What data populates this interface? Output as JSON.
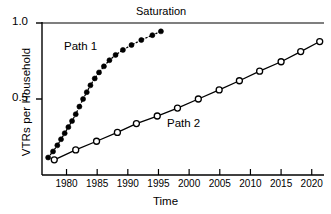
{
  "chart_data": {
    "type": "line",
    "title": "",
    "xlabel": "Time",
    "ylabel": "VTRs per Household",
    "xlim": [
      1976,
      2022
    ],
    "ylim": [
      0.08,
      1.0
    ],
    "grid": false,
    "legend_position": "inline-annotations",
    "ytick_labels": [
      "1.0",
      "0.5"
    ],
    "ytick_values": [
      1.0,
      0.5
    ],
    "xtick_labels": [
      "1980",
      "1985",
      "1990",
      "1995",
      "2000",
      "2005",
      "2010",
      "2015",
      "2020"
    ],
    "xtick_values": [
      1980,
      1985,
      1990,
      1995,
      2000,
      2005,
      2010,
      2015,
      2020
    ],
    "annotations": [
      {
        "text": "Saturation",
        "x": 1996,
        "y": 1.0,
        "name": "saturation-label"
      },
      {
        "text": "Path 1",
        "x": 1982,
        "y": 0.88,
        "name": "path1-label"
      },
      {
        "text": "Path 2",
        "x": 2000,
        "y": 0.42,
        "name": "path2-label"
      }
    ],
    "reference_lines": [
      {
        "name": "saturation-line",
        "orientation": "horizontal",
        "y": 1.0,
        "color": "#000000"
      }
    ],
    "series": [
      {
        "name": "Path 1",
        "marker": "filled-circle",
        "linestyle": "dotted",
        "color": "#000000",
        "x": [
          1977.0,
          1977.8,
          1978.5,
          1979.1,
          1979.7,
          1980.3,
          1980.9,
          1981.5,
          1982.1,
          1982.7,
          1983.3,
          1983.9,
          1984.6,
          1985.3,
          1986.1,
          1987.0,
          1988.0,
          1989.2,
          1990.6,
          1992.2,
          1994.0,
          1995.4
        ],
        "y": [
          0.115,
          0.155,
          0.195,
          0.235,
          0.275,
          0.315,
          0.355,
          0.4,
          0.45,
          0.5,
          0.545,
          0.59,
          0.635,
          0.675,
          0.715,
          0.755,
          0.79,
          0.823,
          0.855,
          0.888,
          0.92,
          0.945
        ]
      },
      {
        "name": "Path 2",
        "marker": "open-circle",
        "linestyle": "solid",
        "color": "#000000",
        "x": [
          1978.0,
          1981.5,
          1984.9,
          1988.3,
          1991.4,
          1994.8,
          1998.1,
          2001.5,
          2004.9,
          2008.2,
          2011.5,
          2015.0,
          2018.2,
          2021.3
        ],
        "y": [
          0.1,
          0.165,
          0.222,
          0.28,
          0.338,
          0.388,
          0.44,
          0.5,
          0.56,
          0.62,
          0.683,
          0.745,
          0.812,
          0.878
        ]
      }
    ]
  }
}
